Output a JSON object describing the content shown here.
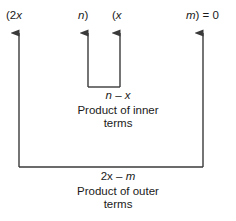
{
  "figure": {
    "name": "foil-method-diagram",
    "equation_terms": {
      "first_factor_open": "(2x",
      "first_factor_close": "n)",
      "second_factor_open": "(x",
      "second_factor_close": "m) = 0"
    },
    "inner": {
      "expression_lead": "n",
      "expression_operator": "–",
      "expression_trail": "x",
      "label_line1": "Product of inner",
      "label_line2": "terms"
    },
    "outer": {
      "expression_lead": "2x",
      "expression_operator": "–",
      "expression_trail": "m",
      "label_line1": "Product of outer",
      "label_line2": "terms"
    },
    "colors": {
      "stroke": "#3a3a3a",
      "text": "#1a1a1a",
      "background": "#ffffff"
    }
  }
}
